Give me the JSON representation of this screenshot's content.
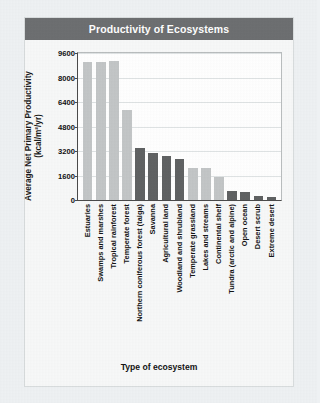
{
  "figure": {
    "title": "Productivity of Ecosystems",
    "x_axis_title": "Type of ecosystem",
    "y_axis_title_line1": "Average Net Primary Productivity",
    "y_axis_title_line2": "(kcal/m²/yr)",
    "colors": {
      "title_bar": "#6d6f71",
      "title_text": "#ffffff",
      "bar_light": "#c3c6c7",
      "bar_dark": "#606263",
      "plot_background": "#ffffff",
      "gridline": "#dfe3e4",
      "page_background": "#eef1f3"
    }
  },
  "chart_data": {
    "type": "bar",
    "title": "Productivity of Ecosystems",
    "xlabel": "Type of ecosystem",
    "ylabel": "Average Net Primary Productivity (kcal/m²/yr)",
    "ylim": [
      0,
      9600
    ],
    "yticks": [
      0,
      1600,
      3200,
      4800,
      6400,
      8000,
      9600
    ],
    "ytick_labels": [
      "0",
      "1600",
      "3200",
      "4800",
      "6400",
      "8000",
      "9600"
    ],
    "grid": true,
    "legend": "none",
    "categories": [
      "Estuaries",
      "Swamps and marshes",
      "Tropical rainforest",
      "Temperate forest",
      "Northern coniferous forest (taiga)",
      "Savanna",
      "Agricultural land",
      "Woodland and shrubland",
      "Temperate grassland",
      "Lakes and streams",
      "Continental shelf",
      "Tundra (arctic and alpine)",
      "Open ocean",
      "Desert scrub",
      "Extreme desert"
    ],
    "values": [
      9000,
      9000,
      9050,
      5900,
      3400,
      3050,
      2900,
      2700,
      2100,
      2100,
      1500,
      600,
      500,
      250,
      200
    ],
    "bar_shades": [
      "light",
      "light",
      "light",
      "light",
      "dark",
      "dark",
      "dark",
      "dark",
      "light",
      "light",
      "light",
      "dark",
      "dark",
      "dark",
      "dark"
    ]
  }
}
